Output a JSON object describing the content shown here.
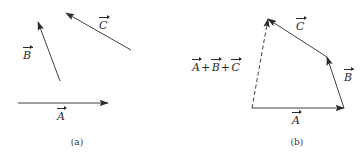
{
  "figure": {
    "background_color": "#ffffff",
    "stroke_color": "#2b2b2b",
    "label_color": "#2b2b2b",
    "caption_color": "#3a3a3a",
    "panels": [
      {
        "id": "a",
        "caption": "(a)",
        "caption_x": 77,
        "caption_y": 142,
        "description": "Three separate vectors A, B and C drawn in isolation",
        "vectors": [
          {
            "name": "A",
            "label": "A",
            "style": "solid",
            "x1": 18,
            "y1": 103,
            "x2": 108,
            "y2": 103,
            "label_x": 57,
            "label_y": 110
          },
          {
            "name": "B",
            "label": "B",
            "style": "solid",
            "x1": 60,
            "y1": 81,
            "x2": 38,
            "y2": 22,
            "label_x": 23,
            "label_y": 49
          },
          {
            "name": "C",
            "label": "C",
            "style": "solid",
            "x1": 131,
            "y1": 50,
            "x2": 66,
            "y2": 13,
            "label_x": 99,
            "label_y": 19
          }
        ]
      },
      {
        "id": "b",
        "caption": "(b)",
        "caption_x": 297,
        "caption_y": 142,
        "description": "Head-to-tail addition of A, B and C with dashed resultant",
        "vectors": [
          {
            "name": "A",
            "label": "A",
            "style": "solid",
            "x1": 252,
            "y1": 108,
            "x2": 344,
            "y2": 108,
            "label_x": 292,
            "label_y": 114
          },
          {
            "name": "B",
            "label": "B",
            "style": "solid",
            "x1": 344,
            "y1": 108,
            "x2": 327,
            "y2": 57,
            "label_x": 344,
            "label_y": 71
          },
          {
            "name": "C",
            "label": "C",
            "style": "solid",
            "x1": 327,
            "y1": 57,
            "x2": 268,
            "y2": 19,
            "label_x": 296,
            "label_y": 20
          },
          {
            "name": "resultant",
            "label_parts": [
              "A",
              "B",
              "C"
            ],
            "plus": "+",
            "style": "dashed",
            "x1": 252,
            "y1": 108,
            "x2": 268,
            "y2": 19,
            "label_x": 192,
            "label_y": 61
          }
        ]
      }
    ]
  }
}
